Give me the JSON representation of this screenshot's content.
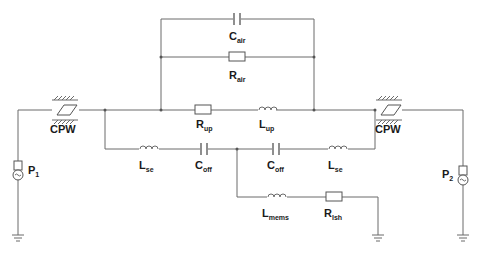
{
  "diagram": {
    "type": "equivalent-circuit",
    "labels": {
      "cpw_left": "CPW",
      "cpw_right": "CPW",
      "c_air": {
        "main": "C",
        "sub": "air"
      },
      "r_air": {
        "main": "R",
        "sub": "air"
      },
      "r_up": {
        "main": "R",
        "sub": "up"
      },
      "l_up": {
        "main": "L",
        "sub": "up"
      },
      "l_se_left": {
        "main": "L",
        "sub": "se"
      },
      "c_off_left": {
        "main": "C",
        "sub": "off"
      },
      "c_off_right": {
        "main": "C",
        "sub": "off"
      },
      "l_se_right": {
        "main": "L",
        "sub": "se"
      },
      "l_mems": {
        "main": "L",
        "sub": "mems"
      },
      "r_lsh": {
        "main": "R",
        "sub": "lsh"
      },
      "port1": {
        "main": "P",
        "sub": "1"
      },
      "port2": {
        "main": "P",
        "sub": "2"
      }
    },
    "components": [
      {
        "id": "CPW_left",
        "kind": "transmission-line"
      },
      {
        "id": "CPW_right",
        "kind": "transmission-line"
      },
      {
        "id": "C_air",
        "kind": "capacitor"
      },
      {
        "id": "R_air",
        "kind": "resistor"
      },
      {
        "id": "R_up",
        "kind": "resistor"
      },
      {
        "id": "L_up",
        "kind": "inductor"
      },
      {
        "id": "L_se_left",
        "kind": "inductor"
      },
      {
        "id": "C_off_left",
        "kind": "capacitor"
      },
      {
        "id": "C_off_right",
        "kind": "capacitor"
      },
      {
        "id": "L_se_right",
        "kind": "inductor"
      },
      {
        "id": "L_mems",
        "kind": "inductor"
      },
      {
        "id": "R_lsh",
        "kind": "resistor"
      },
      {
        "id": "P1",
        "kind": "port"
      },
      {
        "id": "P2",
        "kind": "port"
      }
    ],
    "colors": {
      "wire": "#6b6b6b",
      "text": "#1a1a1a",
      "background": "#ffffff"
    }
  }
}
